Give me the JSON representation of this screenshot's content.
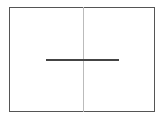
{
  "diagram": {
    "frame": {
      "stroke": "#555555"
    },
    "vertical_divider": {
      "stroke": "#bbbbbb"
    },
    "horizontal_segment": {
      "stroke": "#444444"
    }
  }
}
